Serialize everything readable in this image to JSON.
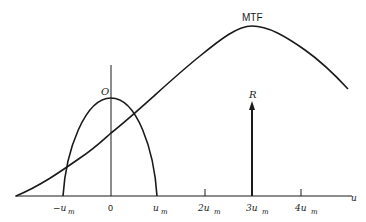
{
  "diagram": {
    "labels": {
      "mtf": "MTF",
      "object": "O",
      "replica": "R",
      "u_axis": "u"
    },
    "ticks": [
      {
        "prefix": "−u",
        "sub": "m"
      },
      {
        "prefix": "0",
        "sub": ""
      },
      {
        "prefix": "u",
        "sub": "m"
      },
      {
        "prefix": "2u",
        "sub": "m"
      },
      {
        "prefix": "3u",
        "sub": "m"
      },
      {
        "prefix": "4u",
        "sub": "m"
      }
    ],
    "colors": {
      "ink": "#1a1a1a",
      "background": "#ffffff"
    }
  }
}
